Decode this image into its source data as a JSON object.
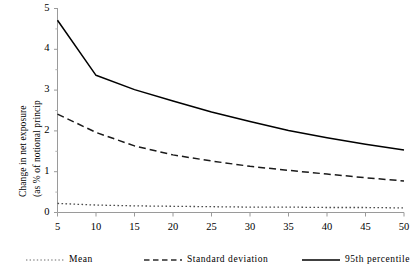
{
  "chart_data": {
    "type": "line",
    "title": "",
    "subtitle": "",
    "xlabel": "",
    "ylabel": "Change in net exposure (as % of notional princip",
    "ylabel_lines": [
      "Change in net exposure",
      "(as % of notional princip"
    ],
    "x": [
      5,
      10,
      15,
      20,
      25,
      30,
      35,
      40,
      45,
      50
    ],
    "xlim": [
      5,
      50
    ],
    "ylim": [
      0,
      5
    ],
    "xticks": [
      "5",
      "10",
      "15",
      "20",
      "25",
      "30",
      "35",
      "40",
      "45",
      "50"
    ],
    "yticks": [
      "0",
      "1",
      "2",
      "3",
      "4",
      "5"
    ],
    "grid": false,
    "legend_position": "bottom",
    "series": [
      {
        "name": "Mean",
        "style": "dotted",
        "color": "#4d4d4d",
        "values": [
          0.21,
          0.17,
          0.15,
          0.14,
          0.13,
          0.12,
          0.12,
          0.11,
          0.11,
          0.1
        ]
      },
      {
        "name": "Standard deviation",
        "style": "dashed",
        "color": "#1a1a1a",
        "values": [
          2.4,
          1.95,
          1.62,
          1.4,
          1.25,
          1.12,
          1.02,
          0.93,
          0.84,
          0.76
        ]
      },
      {
        "name": "95th percentile",
        "style": "solid",
        "color": "#000000",
        "values": [
          4.7,
          3.35,
          3.0,
          2.72,
          2.45,
          2.22,
          2.0,
          1.82,
          1.66,
          1.52
        ]
      }
    ]
  },
  "axes": {
    "y_tick_labels": [
      "5",
      "4",
      "3",
      "2",
      "1",
      "0"
    ],
    "x_tick_labels": [
      "5",
      "10",
      "15",
      "20",
      "25",
      "30",
      "35",
      "40",
      "45",
      "50"
    ]
  },
  "legend": {
    "items": [
      {
        "label": "Mean",
        "style": "dotted"
      },
      {
        "label": "Standard deviation",
        "style": "dashed"
      },
      {
        "label": "95th percentile",
        "style": "solid"
      }
    ]
  },
  "colors": {
    "axis": "#9a9a9a",
    "solid_line": "#000000",
    "dashed_line": "#1a1a1a",
    "dotted_line": "#4d4d4d",
    "text": "#000000",
    "background": "#ffffff"
  }
}
